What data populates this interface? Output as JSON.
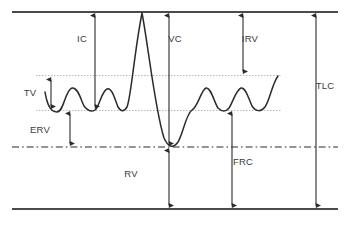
{
  "diagram": {
    "type": "spirogram-diagram",
    "background_color": "#ffffff",
    "trace_color": "#2b2b2b",
    "axis_color": "#4a4a4a",
    "reference_line_color": "#b9b9b9",
    "label_color": "#3a3a3a"
  },
  "reference_levels": {
    "total_lung_capacity_line": {
      "name": "top-border",
      "y": 12,
      "style": "solid"
    },
    "tidal_volume_top_line": {
      "name": "tv-upper",
      "y": 75,
      "style": "dotted"
    },
    "tidal_volume_bottom_line": {
      "name": "tv-lower",
      "y": 110,
      "style": "dotted"
    },
    "residual_volume_line": {
      "name": "frc-baseline",
      "y": 147,
      "style": "dash-dot"
    },
    "bottom_border_line": {
      "name": "bottom-border",
      "y": 209,
      "style": "solid"
    }
  },
  "labels": [
    {
      "id": "ic",
      "text": "IC",
      "x": 82,
      "y": 42,
      "name": "label-inspiratory-capacity"
    },
    {
      "id": "tv",
      "text": "TV",
      "x": 30,
      "y": 96,
      "name": "label-tidal-volume"
    },
    {
      "id": "erv",
      "text": "ERV",
      "x": 40,
      "y": 133,
      "name": "label-expiratory-reserve-volume"
    },
    {
      "id": "rv",
      "text": "RV",
      "x": 131,
      "y": 177,
      "name": "label-residual-volume"
    },
    {
      "id": "vc",
      "text": "VC",
      "x": 175,
      "y": 42,
      "name": "label-vital-capacity"
    },
    {
      "id": "irv",
      "text": "IRV",
      "x": 250,
      "y": 42,
      "name": "label-inspiratory-reserve-volume"
    },
    {
      "id": "frc",
      "text": "FRC",
      "x": 243,
      "y": 165,
      "name": "label-functional-residual-capacity"
    },
    {
      "id": "tlc",
      "text": "TLC",
      "x": 325,
      "y": 89,
      "name": "label-total-lung-capacity"
    }
  ],
  "measurements": [
    {
      "id": "ic",
      "label": "IC",
      "x": 95,
      "y_top": 12,
      "y_bottom": 110,
      "arrowheads": "both"
    },
    {
      "id": "tv",
      "label": "TV",
      "x": 51,
      "y_top": 76,
      "y_bottom": 110,
      "arrowheads": "both"
    },
    {
      "id": "erv",
      "label": "ERV",
      "x": 70,
      "y_top": 110,
      "y_bottom": 147,
      "arrowheads": "both"
    },
    {
      "id": "vc",
      "label": "VC",
      "x": 169,
      "y_top": 12,
      "y_bottom": 147,
      "arrowheads": "both"
    },
    {
      "id": "rv",
      "label": "RV",
      "x": 169,
      "y_top": 147,
      "y_bottom": 209,
      "arrowheads": "both"
    },
    {
      "id": "irv",
      "label": "IRV",
      "x": 243,
      "y_top": 12,
      "y_bottom": 75,
      "arrowheads": "both"
    },
    {
      "id": "frc",
      "label": "FRC",
      "x": 232,
      "y_top": 110,
      "y_bottom": 209,
      "arrowheads": "both"
    },
    {
      "id": "tlc",
      "label": "TLC",
      "x": 316,
      "y_top": 12,
      "y_bottom": 209,
      "arrowheads": "both"
    }
  ],
  "trace": {
    "name": "spirometry-waveform",
    "description": "Breathing trace showing tidal breathing, maximal inspiration to TLC, maximal expiration to RV, then resumed tidal breathing",
    "path": "M 45,92 C 47,104 50,112 57,112 C 64,112 65,90 72,88 C 78,87 81,100 84,106 C 88,111 92,112 95,110 C 99,108 101,92 107,89 C 112,87 115,100 118,107 C 121,112 124,112 127,107 C 131,98 134,54 142,13 C 148,44 155,110 164,138 C 168,147 173,149 178,142 C 183,134 186,114 192,110 C 198,107 201,90 206,88 C 211,87 214,102 218,108 C 222,112 226,112 229,108 C 233,102 236,90 241,88 C 246,87 249,100 252,106 C 256,112 261,112 265,107 C 270,100 272,84 278,76"
  },
  "borders": {
    "top_line": {
      "x1": 12,
      "x2": 338,
      "y": 12
    },
    "bottom_line": {
      "x1": 12,
      "x2": 338,
      "y": 209
    }
  }
}
